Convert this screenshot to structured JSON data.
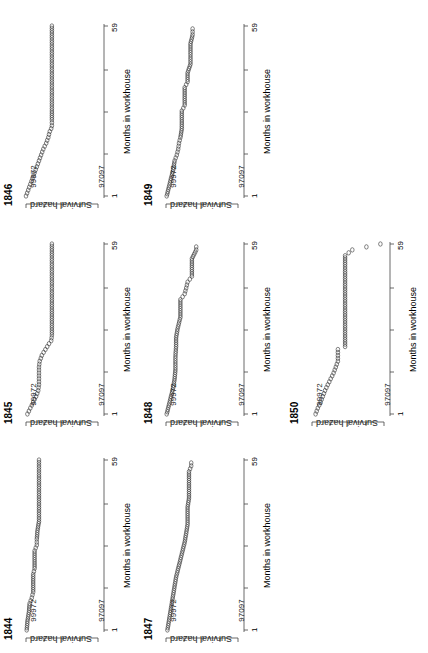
{
  "chart_data": [
    {
      "type": "scatter",
      "title": "1846",
      "xlabel": "Months in workhouse",
      "ylabel": "Survival hazard",
      "xlim": [
        1,
        59
      ],
      "yticks": [
        "99972",
        "97097"
      ],
      "x_ticks": [
        "1",
        "59"
      ],
      "points": [
        [
          1,
          0.0
        ],
        [
          3,
          0.03
        ],
        [
          5,
          0.06
        ],
        [
          7,
          0.09
        ],
        [
          9,
          0.12
        ],
        [
          11,
          0.15
        ],
        [
          13,
          0.18
        ],
        [
          15,
          0.21
        ],
        [
          17,
          0.24
        ],
        [
          19,
          0.28
        ],
        [
          21,
          0.31
        ],
        [
          23,
          0.33
        ],
        [
          24,
          0.35
        ],
        [
          25,
          0.36
        ],
        [
          27,
          0.36
        ],
        [
          30,
          0.36
        ],
        [
          35,
          0.36
        ],
        [
          40,
          0.36
        ],
        [
          45,
          0.36
        ],
        [
          50,
          0.36
        ],
        [
          55,
          0.36
        ],
        [
          59,
          0.36
        ]
      ]
    },
    {
      "type": "scatter",
      "title": "1845",
      "xlabel": "Months in workhouse",
      "ylabel": "Survival hazard",
      "xlim": [
        1,
        59
      ],
      "yticks": [
        "99972",
        "97097"
      ],
      "x_ticks": [
        "1",
        "59"
      ],
      "points": [
        [
          1,
          0.02
        ],
        [
          3,
          0.06
        ],
        [
          5,
          0.1
        ],
        [
          7,
          0.14
        ],
        [
          9,
          0.17
        ],
        [
          11,
          0.18
        ],
        [
          13,
          0.18
        ],
        [
          15,
          0.18
        ],
        [
          17,
          0.18
        ],
        [
          19,
          0.19
        ],
        [
          21,
          0.22
        ],
        [
          23,
          0.27
        ],
        [
          25,
          0.32
        ],
        [
          26,
          0.35
        ],
        [
          28,
          0.36
        ],
        [
          32,
          0.36
        ],
        [
          36,
          0.36
        ],
        [
          40,
          0.36
        ],
        [
          45,
          0.36
        ],
        [
          50,
          0.36
        ],
        [
          55,
          0.36
        ],
        [
          59,
          0.36
        ]
      ]
    },
    {
      "type": "scatter",
      "title": "1844",
      "xlabel": "Months in workhouse",
      "ylabel": "Survival hazard",
      "xlim": [
        1,
        59
      ],
      "yticks": [
        "99972",
        "97097"
      ],
      "x_ticks": [
        "1",
        "59"
      ],
      "points": [
        [
          1,
          0.01
        ],
        [
          4,
          0.02
        ],
        [
          7,
          0.04
        ],
        [
          10,
          0.05
        ],
        [
          12,
          0.08
        ],
        [
          14,
          0.1
        ],
        [
          17,
          0.1
        ],
        [
          20,
          0.1
        ],
        [
          22,
          0.12
        ],
        [
          25,
          0.12
        ],
        [
          28,
          0.12
        ],
        [
          30,
          0.15
        ],
        [
          32,
          0.15
        ],
        [
          35,
          0.16
        ],
        [
          38,
          0.18
        ],
        [
          42,
          0.18
        ],
        [
          46,
          0.18
        ],
        [
          50,
          0.18
        ],
        [
          54,
          0.18
        ],
        [
          59,
          0.18
        ]
      ]
    },
    {
      "type": "scatter",
      "title": "1849",
      "xlabel": "Months in workhouse",
      "ylabel": "Survival hazard",
      "xlim": [
        1,
        59
      ],
      "yticks": [
        "99972",
        "97097"
      ],
      "x_ticks": [
        "1",
        "59"
      ],
      "points": [
        [
          1,
          0.01
        ],
        [
          4,
          0.04
        ],
        [
          7,
          0.07
        ],
        [
          10,
          0.1
        ],
        [
          13,
          0.12
        ],
        [
          15,
          0.15
        ],
        [
          17,
          0.17
        ],
        [
          19,
          0.18
        ],
        [
          21,
          0.2
        ],
        [
          24,
          0.22
        ],
        [
          27,
          0.22
        ],
        [
          30,
          0.22
        ],
        [
          32,
          0.26
        ],
        [
          35,
          0.26
        ],
        [
          38,
          0.26
        ],
        [
          40,
          0.3
        ],
        [
          43,
          0.3
        ],
        [
          46,
          0.34
        ],
        [
          50,
          0.34
        ],
        [
          53,
          0.34
        ],
        [
          56,
          0.37
        ],
        [
          58,
          0.37
        ]
      ]
    },
    {
      "type": "scatter",
      "title": "1848",
      "xlabel": "Months in workhouse",
      "ylabel": "Survival hazard",
      "xlim": [
        1,
        59
      ],
      "yticks": [
        "99972",
        "97097"
      ],
      "x_ticks": [
        "1",
        "59"
      ],
      "points": [
        [
          1,
          0.01
        ],
        [
          4,
          0.04
        ],
        [
          7,
          0.07
        ],
        [
          10,
          0.1
        ],
        [
          13,
          0.12
        ],
        [
          16,
          0.13
        ],
        [
          20,
          0.13
        ],
        [
          24,
          0.14
        ],
        [
          27,
          0.14
        ],
        [
          30,
          0.16
        ],
        [
          34,
          0.2
        ],
        [
          37,
          0.2
        ],
        [
          40,
          0.2
        ],
        [
          42,
          0.26
        ],
        [
          44,
          0.28
        ],
        [
          46,
          0.3
        ],
        [
          48,
          0.36
        ],
        [
          51,
          0.36
        ],
        [
          54,
          0.36
        ],
        [
          57,
          0.42
        ],
        [
          58,
          0.42
        ]
      ]
    },
    {
      "type": "scatter",
      "title": "1847",
      "xlabel": "Months in workhouse",
      "ylabel": "Survival hazard",
      "xlim": [
        1,
        59
      ],
      "yticks": [
        "99972",
        "97097"
      ],
      "x_ticks": [
        "1",
        "59"
      ],
      "points": [
        [
          1,
          0.02
        ],
        [
          4,
          0.04
        ],
        [
          7,
          0.06
        ],
        [
          10,
          0.08
        ],
        [
          13,
          0.1
        ],
        [
          16,
          0.12
        ],
        [
          19,
          0.14
        ],
        [
          22,
          0.17
        ],
        [
          25,
          0.2
        ],
        [
          28,
          0.23
        ],
        [
          31,
          0.26
        ],
        [
          34,
          0.28
        ],
        [
          37,
          0.3
        ],
        [
          40,
          0.3
        ],
        [
          43,
          0.3
        ],
        [
          46,
          0.32
        ],
        [
          49,
          0.32
        ],
        [
          52,
          0.32
        ],
        [
          55,
          0.32
        ],
        [
          57,
          0.35
        ],
        [
          58,
          0.35
        ]
      ]
    },
    {
      "type": "scatter",
      "title": "1850",
      "xlabel": "Months in workhouse",
      "ylabel": "Survival hazard",
      "xlim": [
        1,
        59
      ],
      "yticks": [
        "99972",
        "97097"
      ],
      "x_ticks": [
        "1",
        "59"
      ],
      "points": [
        [
          1,
          0.05
        ],
        [
          3,
          0.08
        ],
        [
          5,
          0.12
        ],
        [
          7,
          0.15
        ],
        [
          9,
          0.18
        ],
        [
          11,
          0.22
        ],
        [
          13,
          0.26
        ],
        [
          15,
          0.3
        ],
        [
          17,
          0.33
        ],
        [
          19,
          0.36
        ],
        [
          21,
          0.36
        ],
        [
          23,
          0.36
        ],
        [
          24,
          0.46
        ],
        [
          28,
          0.46
        ],
        [
          32,
          0.46
        ],
        [
          36,
          0.46
        ],
        [
          40,
          0.46
        ],
        [
          44,
          0.46
        ],
        [
          48,
          0.46
        ],
        [
          52,
          0.46
        ],
        [
          55,
          0.46
        ],
        [
          57,
          0.56
        ],
        [
          59,
          0.95
        ]
      ]
    }
  ],
  "panels": [
    {
      "year": "1846",
      "ylabel": "Survival hazard",
      "xlabel": "Months in workhouse",
      "ytick_hi": "99972",
      "ytick_lo": "97097",
      "xtick_lo": "1",
      "xtick_hi": "59"
    },
    {
      "year": "1845",
      "ylabel": "Survival hazard",
      "xlabel": "Months in workhouse",
      "ytick_hi": "99972",
      "ytick_lo": "97097",
      "xtick_lo": "1",
      "xtick_hi": "59"
    },
    {
      "year": "1844",
      "ylabel": "Survival hazard",
      "xlabel": "Months in workhouse",
      "ytick_hi": "99972",
      "ytick_lo": "97097",
      "xtick_lo": "1",
      "xtick_hi": "59"
    },
    {
      "year": "1849",
      "ylabel": "Survival hazard",
      "xlabel": "Months in workhouse",
      "ytick_hi": "99972",
      "ytick_lo": "97097",
      "xtick_lo": "1",
      "xtick_hi": "59"
    },
    {
      "year": "1848",
      "ylabel": "Survival hazard",
      "xlabel": "Months in workhouse",
      "ytick_hi": "99972",
      "ytick_lo": "97097",
      "xtick_lo": "1",
      "xtick_hi": "59"
    },
    {
      "year": "1847",
      "ylabel": "Survival hazard",
      "xlabel": "Months in workhouse",
      "ytick_hi": "99972",
      "ytick_lo": "97097",
      "xtick_lo": "1",
      "xtick_hi": "59"
    },
    {
      "year": "1850",
      "ylabel": "Survival hazard",
      "xlabel": "Months in workhouse",
      "ytick_hi": "99972",
      "ytick_lo": "97097",
      "xtick_lo": "1",
      "xtick_hi": "59"
    }
  ]
}
